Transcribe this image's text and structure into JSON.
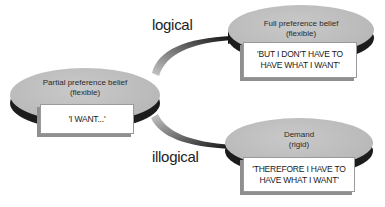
{
  "diagram": {
    "labels": {
      "logical": "logical",
      "illogical": "illogical"
    },
    "nodes": {
      "partial": {
        "title_line1": "Partial preference belief",
        "title_line2": "(flexible)",
        "statement": "'I WANT...'"
      },
      "full": {
        "title_line1": "Full preference belief",
        "title_line2": "(flexible)",
        "statement_line1": "'BUT I DON'T HAVE TO",
        "statement_line2": "HAVE WHAT I WANT'"
      },
      "demand": {
        "title_line1": "Demand",
        "title_line2": "(rigid)",
        "statement_line1": "'THEREFORE I HAVE TO",
        "statement_line2": "HAVE WHAT I WANT'"
      }
    },
    "edges": [
      {
        "from": "partial",
        "to": "full",
        "label": "logical"
      },
      {
        "from": "partial",
        "to": "demand",
        "label": "illogical"
      }
    ],
    "colors": {
      "disc_top": "#bdbdbd",
      "disc_rim": "#1c1c1c",
      "card_shadow": "#8f8f8f",
      "arrow_dark": "#1a1a1a",
      "arrow_light": "#bdbdbd"
    }
  }
}
